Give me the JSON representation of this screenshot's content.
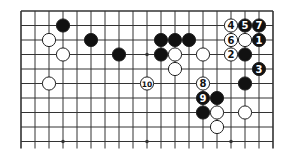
{
  "diagram": {
    "type": "go-board-fragment",
    "grid": {
      "columns": 19,
      "rows": 10,
      "origin_x": 21,
      "origin_y": 11,
      "spacing_x": 14,
      "spacing_y": 14.5,
      "line_color": "#333333",
      "background": "#ffffff",
      "open_edges": [
        "bottom"
      ]
    },
    "star_points": [
      {
        "col": 9,
        "row": 3
      },
      {
        "col": 3,
        "row": 9
      },
      {
        "col": 9,
        "row": 9
      },
      {
        "col": 15,
        "row": 9
      }
    ],
    "stones": [
      {
        "col": 3,
        "row": 1,
        "color": "black",
        "label": ""
      },
      {
        "col": 2,
        "row": 2,
        "color": "white",
        "label": ""
      },
      {
        "col": 5,
        "row": 2,
        "color": "black",
        "label": ""
      },
      {
        "col": 3,
        "row": 3,
        "color": "white",
        "label": ""
      },
      {
        "col": 7,
        "row": 3,
        "color": "black",
        "label": ""
      },
      {
        "col": 10,
        "row": 2,
        "color": "black",
        "label": ""
      },
      {
        "col": 11,
        "row": 2,
        "color": "black",
        "label": ""
      },
      {
        "col": 12,
        "row": 2,
        "color": "black",
        "label": ""
      },
      {
        "col": 10,
        "row": 3,
        "color": "black",
        "label": ""
      },
      {
        "col": 11,
        "row": 3,
        "color": "white",
        "label": ""
      },
      {
        "col": 13,
        "row": 3,
        "color": "white",
        "label": ""
      },
      {
        "col": 11,
        "row": 4,
        "color": "white",
        "label": ""
      },
      {
        "col": 15,
        "row": 1,
        "color": "white",
        "label": "4"
      },
      {
        "col": 16,
        "row": 1,
        "color": "black",
        "label": "5"
      },
      {
        "col": 17,
        "row": 1,
        "color": "black",
        "label": "7"
      },
      {
        "col": 15,
        "row": 2,
        "color": "white",
        "label": "6"
      },
      {
        "col": 16,
        "row": 2,
        "color": "white",
        "label": ""
      },
      {
        "col": 17,
        "row": 2,
        "color": "black",
        "label": "1"
      },
      {
        "col": 15,
        "row": 3,
        "color": "white",
        "label": "2"
      },
      {
        "col": 16,
        "row": 3,
        "color": "black",
        "label": ""
      },
      {
        "col": 17,
        "row": 4,
        "color": "black",
        "label": "3"
      },
      {
        "col": 2,
        "row": 5,
        "color": "white",
        "label": ""
      },
      {
        "col": 9,
        "row": 5,
        "color": "white",
        "label": "10"
      },
      {
        "col": 13,
        "row": 5,
        "color": "white",
        "label": "8"
      },
      {
        "col": 16,
        "row": 5,
        "color": "black",
        "label": ""
      },
      {
        "col": 13,
        "row": 6,
        "color": "black",
        "label": "9"
      },
      {
        "col": 14,
        "row": 6,
        "color": "black",
        "label": ""
      },
      {
        "col": 13,
        "row": 7,
        "color": "black",
        "label": ""
      },
      {
        "col": 14,
        "row": 7,
        "color": "white",
        "label": ""
      },
      {
        "col": 16,
        "row": 7,
        "color": "white",
        "label": ""
      },
      {
        "col": 14,
        "row": 8,
        "color": "white",
        "label": ""
      }
    ],
    "colors": {
      "black_stone": "#111111",
      "white_stone": "#ffffff",
      "stone_outline": "#222222",
      "label_on_black": "#ffffff",
      "label_on_white": "#111111"
    }
  }
}
